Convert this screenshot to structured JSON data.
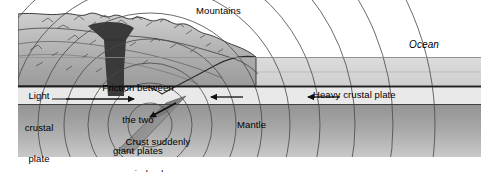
{
  "diagram": {
    "title_hidden": "",
    "canvas": {
      "width": 500,
      "height": 172
    },
    "palette": {
      "page_background": "#ffffff",
      "sky_white": "#ffffff",
      "mountain_light": "#d8d8d8",
      "mountain_mid": "#b4b4b4",
      "mountain_dark": "#9a9a9a",
      "ocean_band": "#d4d4d4",
      "crust_band": "#e6e6e6",
      "mantle_top": "#9d9d9d",
      "mantle_bottom": "#c6c6c6",
      "magma_dark": "#3a3a3a",
      "slab_gray": "#8e8e8e",
      "line_stroke": "#2b2b2b",
      "wave_stroke": "#555555",
      "text": "#000000"
    },
    "labels": {
      "mountains": "Mountains",
      "ocean": "Ocean",
      "light_crustal_plate": "Light\ncrustal\nplate",
      "light_crustal_plate_lines": [
        "Light",
        "crustal",
        "plate"
      ],
      "friction": "Friction between\nthe two\ngiant plates",
      "friction_lines": [
        "Friction between",
        "the two",
        "giant plates"
      ],
      "crust_jerks": "Crust suddenly\njerks down",
      "crust_jerks_lines": [
        "Crust suddenly",
        "jerks down"
      ],
      "mantle": "Mantle",
      "heavy_crustal_plate": "Heavy crustal plate"
    },
    "arrows": [
      {
        "name": "light-plate-motion-arrow",
        "direction": "right",
        "x1": 66,
        "y1": 99,
        "x2": 137,
        "y2": 99
      },
      {
        "name": "heavy-plate-motion-arrow-inner",
        "direction": "left",
        "x1": 243,
        "y1": 97,
        "x2": 208,
        "y2": 97
      },
      {
        "name": "heavy-plate-motion-arrow-outer",
        "direction": "left",
        "x1": 340,
        "y1": 97,
        "x2": 305,
        "y2": 97
      },
      {
        "name": "focus-jerk-arrow",
        "direction": "down-left",
        "x1": 175,
        "y1": 104,
        "x2": 147,
        "y2": 119
      }
    ],
    "features": {
      "seismic_focus": {
        "x": 150,
        "y": 125
      },
      "wave_radii": [
        22,
        42,
        62,
        86,
        112,
        140,
        170,
        205,
        243,
        285
      ],
      "ocean_band_top": 57,
      "ocean_band_bottom": 86,
      "crust_band_top": 86,
      "crust_band_bottom": 105,
      "mantle_top": 105,
      "mantle_bottom": 158,
      "frame_left": 18,
      "frame_right": 481
    }
  }
}
